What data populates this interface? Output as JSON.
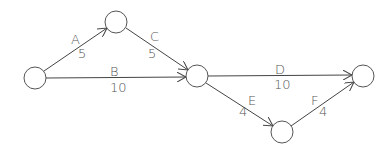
{
  "diagram": {
    "type": "activity-network",
    "nodes": [
      {
        "id": "n1",
        "cx": 35,
        "cy": 78,
        "r": 11
      },
      {
        "id": "n2",
        "cx": 116,
        "cy": 22,
        "r": 11
      },
      {
        "id": "n3",
        "cx": 197,
        "cy": 76,
        "r": 11
      },
      {
        "id": "n4",
        "cx": 363,
        "cy": 76,
        "r": 11
      },
      {
        "id": "n5",
        "cx": 282,
        "cy": 132,
        "r": 11
      }
    ],
    "edges": [
      {
        "name": "A",
        "duration": "5",
        "from": "n1",
        "to": "n2"
      },
      {
        "name": "B",
        "duration": "10",
        "from": "n1",
        "to": "n3"
      },
      {
        "name": "C",
        "duration": "5",
        "from": "n2",
        "to": "n3"
      },
      {
        "name": "D",
        "duration": "10",
        "from": "n3",
        "to": "n4"
      },
      {
        "name": "E",
        "duration": "4",
        "from": "n3",
        "to": "n5"
      },
      {
        "name": "F",
        "duration": "4",
        "from": "n5",
        "to": "n4"
      }
    ]
  },
  "labels": {
    "A": "A",
    "A_dur": "5",
    "B": "B",
    "B_dur": "10",
    "C": "C",
    "C_dur": "5",
    "D": "D",
    "D_dur": "10",
    "E": "E",
    "E_dur": "4",
    "F": "F",
    "F_dur": "4"
  }
}
